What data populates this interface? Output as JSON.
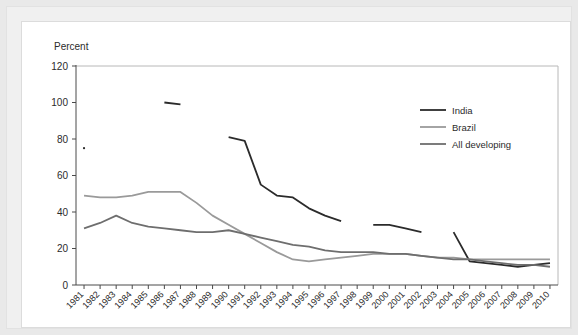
{
  "panel": {
    "y_axis_title": "Percent"
  },
  "legend": {
    "position": "top-right",
    "entries": [
      {
        "label": "India",
        "color": "#2b2b2b"
      },
      {
        "label": "Brazil",
        "color": "#9a9a9a"
      },
      {
        "label": "All developing",
        "color": "#6e6e6e"
      }
    ]
  },
  "chart_data": {
    "type": "line",
    "title": "",
    "subtitle": "",
    "xlabel": "",
    "ylabel": "Percent",
    "grid": false,
    "legend_position": "top-right",
    "xlim": [
      1981,
      2010
    ],
    "ylim": [
      0,
      120
    ],
    "yticks": [
      0,
      20,
      40,
      60,
      80,
      100,
      120
    ],
    "ytick_labels": [
      "0",
      "20",
      "40",
      "60",
      "80",
      "100",
      "120"
    ],
    "x": [
      1981,
      1982,
      1983,
      1984,
      1985,
      1986,
      1987,
      1988,
      1989,
      1990,
      1991,
      1992,
      1993,
      1994,
      1995,
      1996,
      1997,
      1998,
      1999,
      2000,
      2001,
      2002,
      2003,
      2004,
      2005,
      2006,
      2007,
      2008,
      2009,
      2010
    ],
    "xtick_labels": [
      "1981",
      "1982",
      "1983",
      "1984",
      "1985",
      "1986",
      "1987",
      "1988",
      "1989",
      "1990",
      "1991",
      "1992",
      "1993",
      "1994",
      "1995",
      "1996",
      "1997",
      "1998",
      "1999",
      "2000",
      "2001",
      "2002",
      "2003",
      "2004",
      "2005",
      "2006",
      "2007",
      "2008",
      "2009",
      "2010"
    ],
    "series": [
      {
        "name": "India",
        "color": "#2b2b2b",
        "values": [
          75,
          null,
          null,
          null,
          null,
          100,
          99,
          null,
          null,
          81,
          79,
          55,
          49,
          48,
          42,
          38,
          35,
          null,
          33,
          33,
          31,
          29,
          null,
          29,
          13,
          12,
          11,
          10,
          11,
          12
        ]
      },
      {
        "name": "Brazil",
        "color": "#9a9a9a",
        "values": [
          49,
          48,
          48,
          49,
          51,
          51,
          51,
          45,
          38,
          33,
          28,
          23,
          18,
          14,
          13,
          14,
          15,
          16,
          17,
          17,
          17,
          16,
          15,
          15,
          14,
          14,
          14,
          14,
          14,
          14
        ]
      },
      {
        "name": "All developing",
        "color": "#6e6e6e",
        "values": [
          31,
          34,
          38,
          34,
          32,
          31,
          30,
          29,
          29,
          30,
          28,
          26,
          24,
          22,
          21,
          19,
          18,
          18,
          18,
          17,
          17,
          16,
          15,
          14,
          14,
          13,
          12,
          11,
          11,
          10
        ]
      }
    ]
  }
}
